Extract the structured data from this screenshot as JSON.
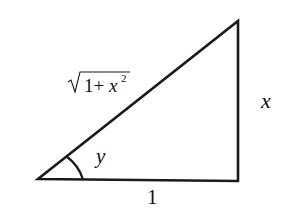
{
  "diagram": {
    "type": "right-triangle",
    "stroke_color": "#1a1a1a",
    "labels": {
      "hypotenuse": "1+x",
      "hypotenuse_exponent": "2",
      "opposite": "x",
      "adjacent": "1",
      "angle": "y"
    }
  }
}
